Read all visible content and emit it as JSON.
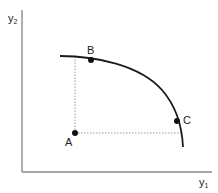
{
  "diagram": {
    "type": "production-possibility-frontier",
    "axes": {
      "y_label": "y",
      "y_subscript": "2",
      "x_label": "y",
      "x_subscript": "1"
    },
    "points": [
      {
        "id": "A",
        "label": "A",
        "position": "inside frontier"
      },
      {
        "id": "B",
        "label": "B",
        "position": "on frontier"
      },
      {
        "id": "C",
        "label": "C",
        "position": "on frontier"
      }
    ],
    "guides": [
      {
        "from": "A",
        "direction": "vertical",
        "style": "dotted"
      },
      {
        "from": "A",
        "direction": "horizontal",
        "style": "dotted"
      }
    ],
    "colors": {
      "axis": "#888888",
      "curve": "#1a1a1a",
      "point": "#111111",
      "guide": "#999999"
    }
  }
}
